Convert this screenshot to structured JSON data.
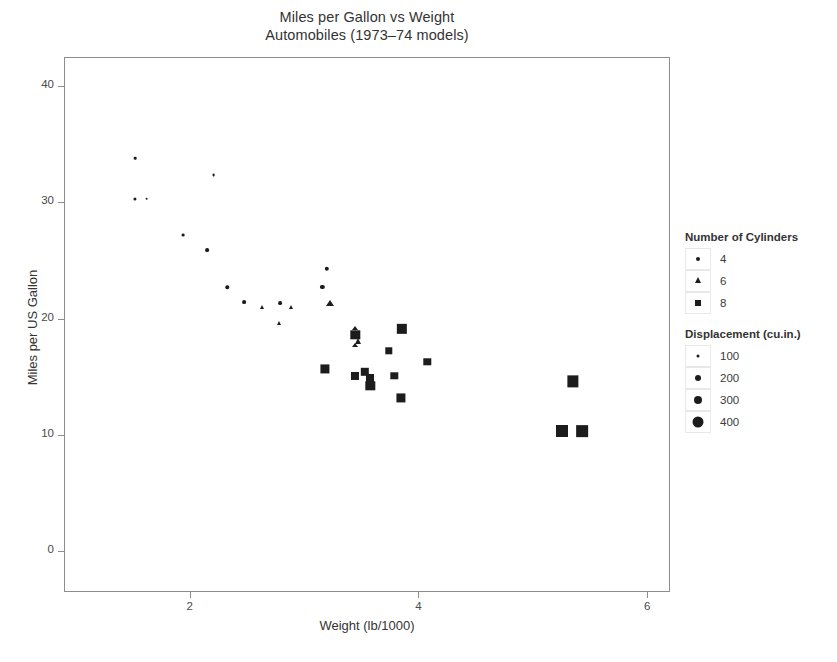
{
  "chart_data": {
    "type": "scatter",
    "title": "Miles per Gallon vs Weight",
    "subtitle": "Automobiles (1973–74 models)",
    "xlabel": "Weight (lb/1000)",
    "ylabel": "Miles per US Gallon",
    "xlim": [
      0.9,
      6.2
    ],
    "ylim": [
      -3.5,
      42.5
    ],
    "xticks": [
      2,
      4,
      6
    ],
    "yticks": [
      0,
      10,
      20,
      30,
      40
    ],
    "grid": false,
    "legend_position": "right",
    "encodings": {
      "shape": "cyl",
      "size": "disp"
    },
    "points": [
      {
        "label": "Toyota Corolla",
        "wt": 1.513,
        "mpg": 33.9,
        "cyl": 4,
        "disp": 71.1
      },
      {
        "label": "Honda Civic",
        "wt": 1.615,
        "mpg": 30.4,
        "cyl": 4,
        "disp": 75.7
      },
      {
        "label": "Lotus Europa",
        "wt": 1.513,
        "mpg": 30.4,
        "cyl": 4,
        "disp": 95.1
      },
      {
        "label": "Fiat X1-9",
        "wt": 1.935,
        "mpg": 27.3,
        "cyl": 4,
        "disp": 79.0
      },
      {
        "label": "Porsche 914-2",
        "wt": 2.14,
        "mpg": 26.0,
        "cyl": 4,
        "disp": 120.3
      },
      {
        "label": "Fiat 128",
        "wt": 2.2,
        "mpg": 32.4,
        "cyl": 4,
        "disp": 78.7
      },
      {
        "label": "Toyota Corona",
        "wt": 2.465,
        "mpg": 21.5,
        "cyl": 4,
        "disp": 120.1
      },
      {
        "label": "Datsun 710",
        "wt": 2.32,
        "mpg": 22.8,
        "cyl": 4,
        "disp": 108.0
      },
      {
        "label": "Merc 240D",
        "wt": 3.19,
        "mpg": 24.4,
        "cyl": 4,
        "disp": 146.7
      },
      {
        "label": "Merc 230",
        "wt": 3.15,
        "mpg": 22.8,
        "cyl": 4,
        "disp": 140.8
      },
      {
        "label": "Volvo 142E",
        "wt": 2.78,
        "mpg": 21.4,
        "cyl": 4,
        "disp": 121.0
      },
      {
        "label": "Mazda RX4",
        "wt": 2.62,
        "mpg": 21.0,
        "cyl": 6,
        "disp": 160.0
      },
      {
        "label": "Mazda RX4 Wag",
        "wt": 2.875,
        "mpg": 21.0,
        "cyl": 6,
        "disp": 160.0
      },
      {
        "label": "Hornet 4 Drive",
        "wt": 3.215,
        "mpg": 21.4,
        "cyl": 6,
        "disp": 258.0
      },
      {
        "label": "Valiant",
        "wt": 3.46,
        "mpg": 18.1,
        "cyl": 6,
        "disp": 225.0
      },
      {
        "label": "Merc 280",
        "wt": 3.44,
        "mpg": 19.2,
        "cyl": 6,
        "disp": 167.6
      },
      {
        "label": "Merc 280C",
        "wt": 3.44,
        "mpg": 17.8,
        "cyl": 6,
        "disp": 167.6
      },
      {
        "label": "Ferrari Dino",
        "wt": 2.77,
        "mpg": 19.7,
        "cyl": 6,
        "disp": 145.0
      },
      {
        "label": "Hornet Sportabout",
        "wt": 3.44,
        "mpg": 18.7,
        "cyl": 8,
        "disp": 360.0
      },
      {
        "label": "Duster 360",
        "wt": 3.57,
        "mpg": 14.3,
        "cyl": 8,
        "disp": 360.0
      },
      {
        "label": "Merc 450SE",
        "wt": 4.07,
        "mpg": 16.4,
        "cyl": 8,
        "disp": 275.8
      },
      {
        "label": "Merc 450SL",
        "wt": 3.73,
        "mpg": 17.3,
        "cyl": 8,
        "disp": 275.8
      },
      {
        "label": "Merc 450SLC",
        "wt": 3.78,
        "mpg": 15.2,
        "cyl": 8,
        "disp": 275.8
      },
      {
        "label": "Cadillac Fleetwood",
        "wt": 5.25,
        "mpg": 10.4,
        "cyl": 8,
        "disp": 472.0
      },
      {
        "label": "Lincoln Continental",
        "wt": 5.424,
        "mpg": 10.4,
        "cyl": 8,
        "disp": 460.0
      },
      {
        "label": "Chrysler Imperial",
        "wt": 5.345,
        "mpg": 14.7,
        "cyl": 8,
        "disp": 440.0
      },
      {
        "label": "Dodge Challenger",
        "wt": 3.52,
        "mpg": 15.5,
        "cyl": 8,
        "disp": 318.0
      },
      {
        "label": "AMC Javelin",
        "wt": 3.435,
        "mpg": 15.2,
        "cyl": 8,
        "disp": 304.0
      },
      {
        "label": "Camaro Z28",
        "wt": 3.84,
        "mpg": 13.3,
        "cyl": 8,
        "disp": 350.0
      },
      {
        "label": "Pontiac Firebird",
        "wt": 3.845,
        "mpg": 19.2,
        "cyl": 8,
        "disp": 400.0
      },
      {
        "label": "Ford Pantera L",
        "wt": 3.17,
        "mpg": 15.8,
        "cyl": 8,
        "disp": 351.0
      },
      {
        "label": "Maserati Bora",
        "wt": 3.57,
        "mpg": 15.0,
        "cyl": 8,
        "disp": 301.0
      }
    ]
  },
  "legends": [
    {
      "name": "cylinders",
      "title": "Number of Cylinders",
      "entries": [
        {
          "label": "4",
          "shape": "circle",
          "size": 4
        },
        {
          "label": "6",
          "shape": "triangle",
          "size": 6
        },
        {
          "label": "8",
          "shape": "square",
          "size": 6
        }
      ]
    },
    {
      "name": "displacement",
      "title": "Displacement (cu.in.)",
      "entries": [
        {
          "label": "100",
          "shape": "circle",
          "size": 3
        },
        {
          "label": "200",
          "shape": "circle",
          "size": 6
        },
        {
          "label": "300",
          "shape": "circle",
          "size": 8
        },
        {
          "label": "400",
          "shape": "circle",
          "size": 11
        }
      ]
    }
  ],
  "style": {
    "marker_color": "#1c1c1c",
    "frame_color": "#8d8d8d",
    "text_color": "#333333"
  }
}
